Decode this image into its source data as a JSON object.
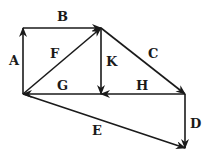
{
  "diagram": {
    "type": "vector-diagram",
    "points": {
      "O": [
        23,
        94
      ],
      "T": [
        23,
        28
      ],
      "P": [
        101,
        28
      ],
      "M": [
        101,
        94
      ],
      "Q": [
        185,
        94
      ],
      "R": [
        185,
        148
      ]
    },
    "vectors": [
      {
        "label": "A",
        "from": "O",
        "to": "T",
        "label_pos": [
          9,
          65
        ]
      },
      {
        "label": "B",
        "from": "T",
        "to": "P",
        "label_pos": [
          57,
          21
        ]
      },
      {
        "label": "C",
        "from": "P",
        "to": "Q",
        "label_pos": [
          148,
          58
        ]
      },
      {
        "label": "D",
        "from": "Q",
        "to": "R",
        "label_pos": [
          190,
          128
        ]
      },
      {
        "label": "E",
        "from": "O",
        "to": "R",
        "label_pos": [
          92,
          135
        ]
      },
      {
        "label": "F",
        "from": "O",
        "to": "P",
        "label_pos": [
          50,
          58
        ]
      },
      {
        "label": "G",
        "from": "M",
        "to": "O",
        "label_pos": [
          57,
          90
        ]
      },
      {
        "label": "H",
        "from": "Q",
        "to": "M",
        "label_pos": [
          136,
          90
        ]
      },
      {
        "label": "K",
        "from": "P",
        "to": "M",
        "label_pos": [
          106,
          66
        ]
      }
    ]
  }
}
